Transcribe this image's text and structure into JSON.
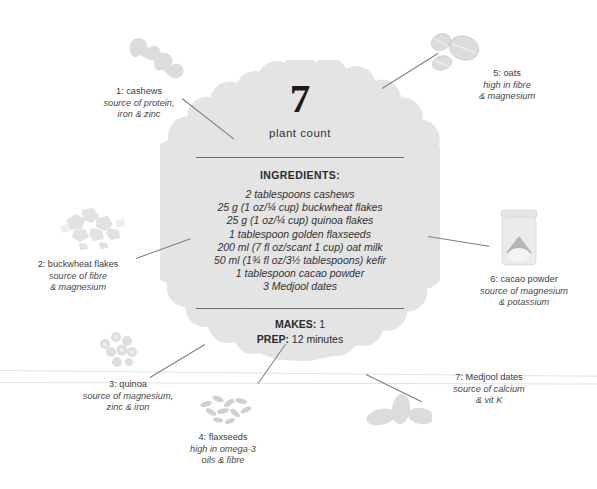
{
  "card": {
    "plant_number": "7",
    "plant_count_label": "plant count",
    "ingredients_heading": "INGREDIENTS:",
    "ingredients": [
      "2 tablespoons cashews",
      "25 g (1 oz/¼ cup) buckwheat flakes",
      "25 g (1 oz/¼ cup) quinoa flakes",
      "1 tablespoon golden flaxseeds",
      "200 ml (7 fl oz/scant 1 cup) oat milk",
      "50 ml (1¾ fl oz/3½ tablespoons) kefir",
      "1 tablespoon cacao powder",
      "3 Medjool dates"
    ],
    "makes_key": "MAKES:",
    "makes_value": "1",
    "prep_key": "PREP:",
    "prep_value": "12 minutes"
  },
  "callouts": [
    {
      "id": "callout-1",
      "title": "1: cashews",
      "desc_line1": "source of protein,",
      "desc_line2": "iron & zinc",
      "icon": "cashews-illustration"
    },
    {
      "id": "callout-2",
      "title": "2: buckwheat flakes",
      "desc_line1": "source of fibre",
      "desc_line2": "& magnesium",
      "icon": "buckwheat-flakes-illustration"
    },
    {
      "id": "callout-3",
      "title": "3: quinoa",
      "desc_line1": "source of magnesium,",
      "desc_line2": "zinc & iron",
      "icon": "quinoa-illustration"
    },
    {
      "id": "callout-4",
      "title": "4: flaxseeds",
      "desc_line1": "high in omega-3",
      "desc_line2": "oils & fibre",
      "icon": "flaxseeds-illustration"
    },
    {
      "id": "callout-5",
      "title": "5: oats",
      "desc_line1": "high in fibre",
      "desc_line2": "& magnesium",
      "icon": "oats-illustration"
    },
    {
      "id": "callout-6",
      "title": "6: cacao powder",
      "desc_line1": "source of magnesium",
      "desc_line2": "& potassium",
      "icon": "cacao-powder-jar-illustration"
    },
    {
      "id": "callout-7",
      "title": "7: Medjool dates",
      "desc_line1": "source of calcium",
      "desc_line2": "& vit K",
      "icon": "medjool-dates-illustration"
    }
  ],
  "colors": {
    "page_background": "#ffffff",
    "medallion_fill": "#e4e4e4",
    "illustration_fill": "#dcdcdc",
    "illustration_fill_light": "#ededed",
    "cacao_powder_dark": "#b5b5b5",
    "text_primary": "#1a1a1a",
    "text_body": "#333333",
    "text_callout": "#3d3d3d",
    "rule": "#6d6d6d",
    "leader_line": "#7d7d7d",
    "scan_line": "#e3e3e3"
  }
}
